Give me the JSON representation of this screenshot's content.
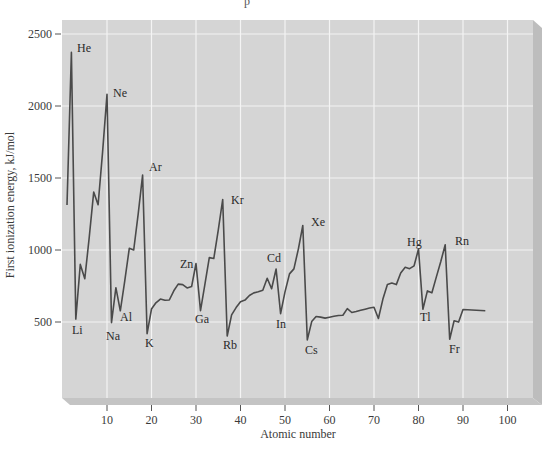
{
  "page_fragment": "p",
  "chart_data": {
    "type": "line",
    "title": "",
    "xlabel": "Atomic number",
    "ylabel": "First ionization energy, kJ/mol",
    "xlim": [
      0,
      106
    ],
    "ylim": [
      0,
      2600
    ],
    "x_ticks": [
      10,
      20,
      30,
      40,
      50,
      60,
      70,
      80,
      90,
      100
    ],
    "y_ticks": [
      500,
      1000,
      1500,
      2000,
      2500
    ],
    "grid": true,
    "legend": null,
    "series": [
      {
        "name": "First ionization energy",
        "x": [
          1,
          2,
          3,
          4,
          5,
          6,
          7,
          8,
          9,
          10,
          11,
          12,
          13,
          14,
          15,
          16,
          17,
          18,
          19,
          20,
          21,
          22,
          23,
          24,
          25,
          26,
          27,
          28,
          29,
          30,
          31,
          32,
          33,
          34,
          35,
          36,
          37,
          38,
          39,
          40,
          41,
          42,
          43,
          44,
          45,
          46,
          47,
          48,
          49,
          50,
          51,
          52,
          53,
          54,
          55,
          56,
          57,
          58,
          59,
          60,
          61,
          62,
          63,
          64,
          65,
          66,
          67,
          68,
          69,
          70,
          71,
          72,
          73,
          74,
          75,
          76,
          77,
          78,
          79,
          80,
          81,
          82,
          83,
          84,
          85,
          86,
          87,
          88,
          89,
          90,
          95
        ],
        "values": [
          1312,
          2372,
          520,
          900,
          801,
          1086,
          1402,
          1314,
          1681,
          2081,
          496,
          738,
          578,
          787,
          1012,
          1000,
          1251,
          1521,
          419,
          590,
          633,
          659,
          651,
          653,
          717,
          763,
          760,
          737,
          746,
          906,
          579,
          762,
          947,
          941,
          1140,
          1351,
          403,
          550,
          600,
          640,
          652,
          684,
          702,
          710,
          720,
          804,
          731,
          868,
          558,
          709,
          834,
          869,
          1008,
          1170,
          376,
          503,
          538,
          534,
          527,
          533,
          540,
          545,
          547,
          593,
          566,
          573,
          581,
          589,
          597,
          603,
          524,
          659,
          761,
          770,
          760,
          840,
          880,
          870,
          890,
          1007,
          589,
          716,
          703,
          812,
          920,
          1037,
          380,
          509,
          499,
          587,
          578
        ]
      }
    ],
    "annotations": [
      {
        "text": "He",
        "z": 2
      },
      {
        "text": "Ne",
        "z": 10
      },
      {
        "text": "Ar",
        "z": 18
      },
      {
        "text": "Kr",
        "z": 36
      },
      {
        "text": "Xe",
        "z": 54
      },
      {
        "text": "Rn",
        "z": 86
      },
      {
        "text": "Li",
        "z": 3
      },
      {
        "text": "Na",
        "z": 11
      },
      {
        "text": "Al",
        "z": 13
      },
      {
        "text": "K",
        "z": 19
      },
      {
        "text": "Zn",
        "z": 30
      },
      {
        "text": "Ga",
        "z": 31
      },
      {
        "text": "Rb",
        "z": 37
      },
      {
        "text": "Cd",
        "z": 48
      },
      {
        "text": "In",
        "z": 49
      },
      {
        "text": "Cs",
        "z": 55
      },
      {
        "text": "Hg",
        "z": 80
      },
      {
        "text": "Tl",
        "z": 81
      },
      {
        "text": "Fr",
        "z": 87
      }
    ]
  },
  "labels": {
    "x_axis_title": "Atomic number",
    "y_axis_title": "First ionization energy, kJ/mol",
    "x_ticks": [
      "10",
      "20",
      "30",
      "40",
      "50",
      "60",
      "70",
      "80",
      "90",
      "100"
    ],
    "y_ticks": [
      "500",
      "1000",
      "1500",
      "2000",
      "2500"
    ],
    "elements": {
      "He": "He",
      "Ne": "Ne",
      "Ar": "Ar",
      "Kr": "Kr",
      "Xe": "Xe",
      "Rn": "Rn",
      "Li": "Li",
      "Na": "Na",
      "Al": "Al",
      "K": "K",
      "Zn": "Zn",
      "Ga": "Ga",
      "Rb": "Rb",
      "Cd": "Cd",
      "In": "In",
      "Cs": "Cs",
      "Hg": "Hg",
      "Tl": "Tl",
      "Fr": "Fr"
    }
  },
  "colors": {
    "plot_bg": "#d5d5d5",
    "bevel_bottom": "#c4c4c4",
    "bevel_side": "#bdbdbd",
    "grid": "#f4f4f4",
    "line": "#4a4a4a",
    "text": "#333333"
  }
}
